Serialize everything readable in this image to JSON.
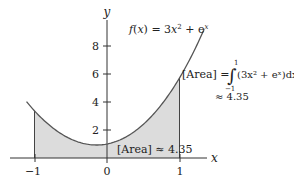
{
  "figure": {
    "function_label": "f(x) = 3x² + eˣ",
    "function_label_parts": {
      "f": "f",
      "paren_open": "(",
      "x": "x",
      "paren_close": ")",
      "eq": " = 3",
      "x2": "x",
      "sq": "2",
      "plus": " + e",
      "exp": "x"
    },
    "x_axis_label": "x",
    "y_axis_label": "y",
    "x_ticks": [
      "−1",
      "0",
      "1"
    ],
    "y_ticks": [
      "2",
      "4",
      "6",
      "8"
    ],
    "integral_annotation": {
      "lhs": "[Area] = ",
      "upper_limit": "1",
      "lower_limit": "−1",
      "integrand": "(3x² + eˣ)dx",
      "approx": "≈ 4.35"
    },
    "area_label": "[Area] ≈ 4.35",
    "colors": {
      "curve": "#555555",
      "fill": "#dcdcdc",
      "axis": "#333333"
    }
  },
  "chart_data": {
    "type": "area",
    "xlabel": "x",
    "ylabel": "y",
    "x_ticks": [
      -1,
      0,
      1
    ],
    "y_ticks": [
      2,
      4,
      6,
      8
    ],
    "xlim": [
      -1.35,
      1.4
    ],
    "ylim": [
      0,
      10
    ],
    "shaded_interval": [
      -1,
      1
    ],
    "area_value": 4.35,
    "series": [
      {
        "name": "f(x) = 3x^2 + e^x",
        "x": [
          -1.1,
          -1.0,
          -0.8,
          -0.6,
          -0.4,
          -0.2,
          0.0,
          0.2,
          0.4,
          0.6,
          0.8,
          1.0,
          1.2,
          1.34
        ],
        "y": [
          3.96,
          3.37,
          2.37,
          1.63,
          1.15,
          0.94,
          1.0,
          1.34,
          1.97,
          2.9,
          4.15,
          5.72,
          7.64,
          9.2
        ]
      }
    ],
    "grid": false
  }
}
